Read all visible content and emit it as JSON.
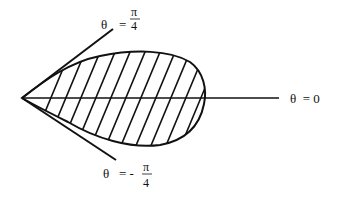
{
  "diagram": {
    "labels": {
      "upper_ray": {
        "theta": "θ",
        "eq": "=",
        "num": "π",
        "den": "4"
      },
      "axis": {
        "text": "θ  = 0"
      },
      "lower_ray": {
        "theta": "θ",
        "eq": "= -",
        "num": "π",
        "den": "4"
      }
    },
    "colors": {
      "stroke": "#111111",
      "background": "#ffffff"
    }
  }
}
